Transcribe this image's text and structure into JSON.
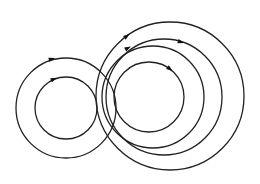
{
  "diagram": {
    "stroke_color": "#222222",
    "arrow_color": "#111111",
    "stroke_width": 1.3,
    "circles": [
      {
        "id": "left-outer",
        "cx": 66,
        "cy": 108,
        "r": 50,
        "arrow": {
          "x": 52,
          "y": 59
        }
      },
      {
        "id": "left-inner",
        "cx": 66,
        "cy": 108,
        "r": 31,
        "arrow": {
          "x": 54,
          "y": 79
        }
      },
      {
        "id": "right-large",
        "cx": 170,
        "cy": 96,
        "r": 74,
        "arrow": {
          "x": 127,
          "y": 36
        }
      },
      {
        "id": "right-mid2",
        "cx": 164,
        "cy": 97,
        "r": 58,
        "arrow": {
          "x": 181,
          "y": 42
        }
      },
      {
        "id": "right-mid1",
        "cx": 153,
        "cy": 97,
        "r": 51,
        "arrow": {
          "x": 128,
          "y": 48
        }
      },
      {
        "id": "right-inner",
        "cx": 149,
        "cy": 97,
        "r": 35,
        "arrow": {
          "x": 170,
          "y": 69
        }
      }
    ]
  }
}
